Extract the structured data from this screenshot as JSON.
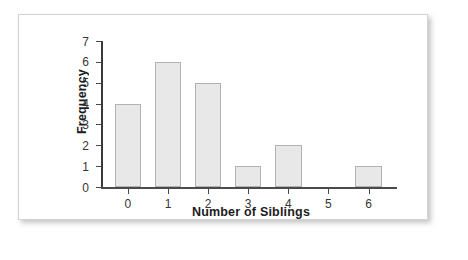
{
  "chart_data": {
    "type": "bar",
    "title": "",
    "subtitle": "",
    "xlabel": "Number of Siblings",
    "ylabel": "Frequency",
    "categories": [
      "0",
      "1",
      "2",
      "3",
      "4",
      "5",
      "6"
    ],
    "values": [
      4,
      6,
      5,
      1,
      2,
      0,
      1
    ],
    "series": [
      {
        "name": "Frequency",
        "values": [
          4,
          6,
          5,
          1,
          2,
          0,
          1
        ]
      }
    ],
    "ylim": [
      0,
      7
    ],
    "y_ticks": [
      "0",
      "1",
      "2",
      "3",
      "4",
      "5",
      "6",
      "7"
    ],
    "x_ticks": [
      "0",
      "1",
      "2",
      "3",
      "4",
      "5",
      "6"
    ],
    "grid": false,
    "legend": false,
    "legend_position": "none",
    "annotations": [],
    "colors": {
      "bar_fill": "#e8e8e8",
      "bar_border": "#b2b2b2",
      "axis": "#3a3a3a",
      "text": "#1d1d1d",
      "panel_background": "#ffffff",
      "panel_border": "#d2d2d2"
    }
  }
}
